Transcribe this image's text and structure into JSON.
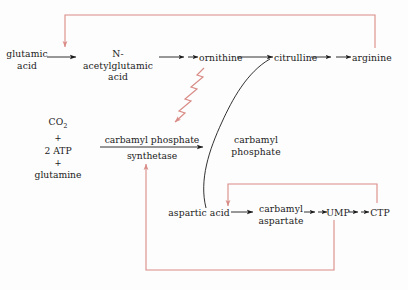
{
  "diagram": {
    "colors": {
      "arrow_black": "#1b1b1b",
      "feedback_red": "#d98b86",
      "text": "#1b1b1b",
      "background": "#fdfdfd"
    },
    "nodes": {
      "glutamic_acid_line1": "glutamic",
      "glutamic_acid_line2": "acid",
      "n_acetylglutamic_line1": "N-acetylglutamic",
      "n_acetylglutamic_line2": "acid",
      "ornithine": "ornithine",
      "citrulline": "citrulline",
      "arginine": "arginine",
      "carbamyl_phosphate_mid_line1": "carbamyl",
      "carbamyl_phosphate_mid_line2": "phosphate",
      "aspartic_acid": "aspartic acid",
      "carbamyl_aspartate_line1": "carbamyl",
      "carbamyl_aspartate_line2": "aspartate",
      "ump": "UMP",
      "ctp": "CTP"
    },
    "reagents": {
      "co2": "CO",
      "co2_sub": "2",
      "plus_1": "+",
      "atp": "2 ATP",
      "plus_2": "+",
      "glutamine": "glutamine"
    },
    "enzyme": {
      "product_label": "carbamyl phosphate",
      "enzyme_label": "synthetase"
    },
    "feedback": {
      "arginine_inhibits": "arginine feedback inhibition of glutamic acid acetylation",
      "ornithine_activates": "ornithine squiggly activation of carbamyl phosphate synthetase",
      "ump_inhibits": "UMP feedback inhibition of carbamyl phosphate synthetase",
      "ctp_inhibits": "CTP feedback inhibition of aspartate transcarbamylase"
    }
  }
}
